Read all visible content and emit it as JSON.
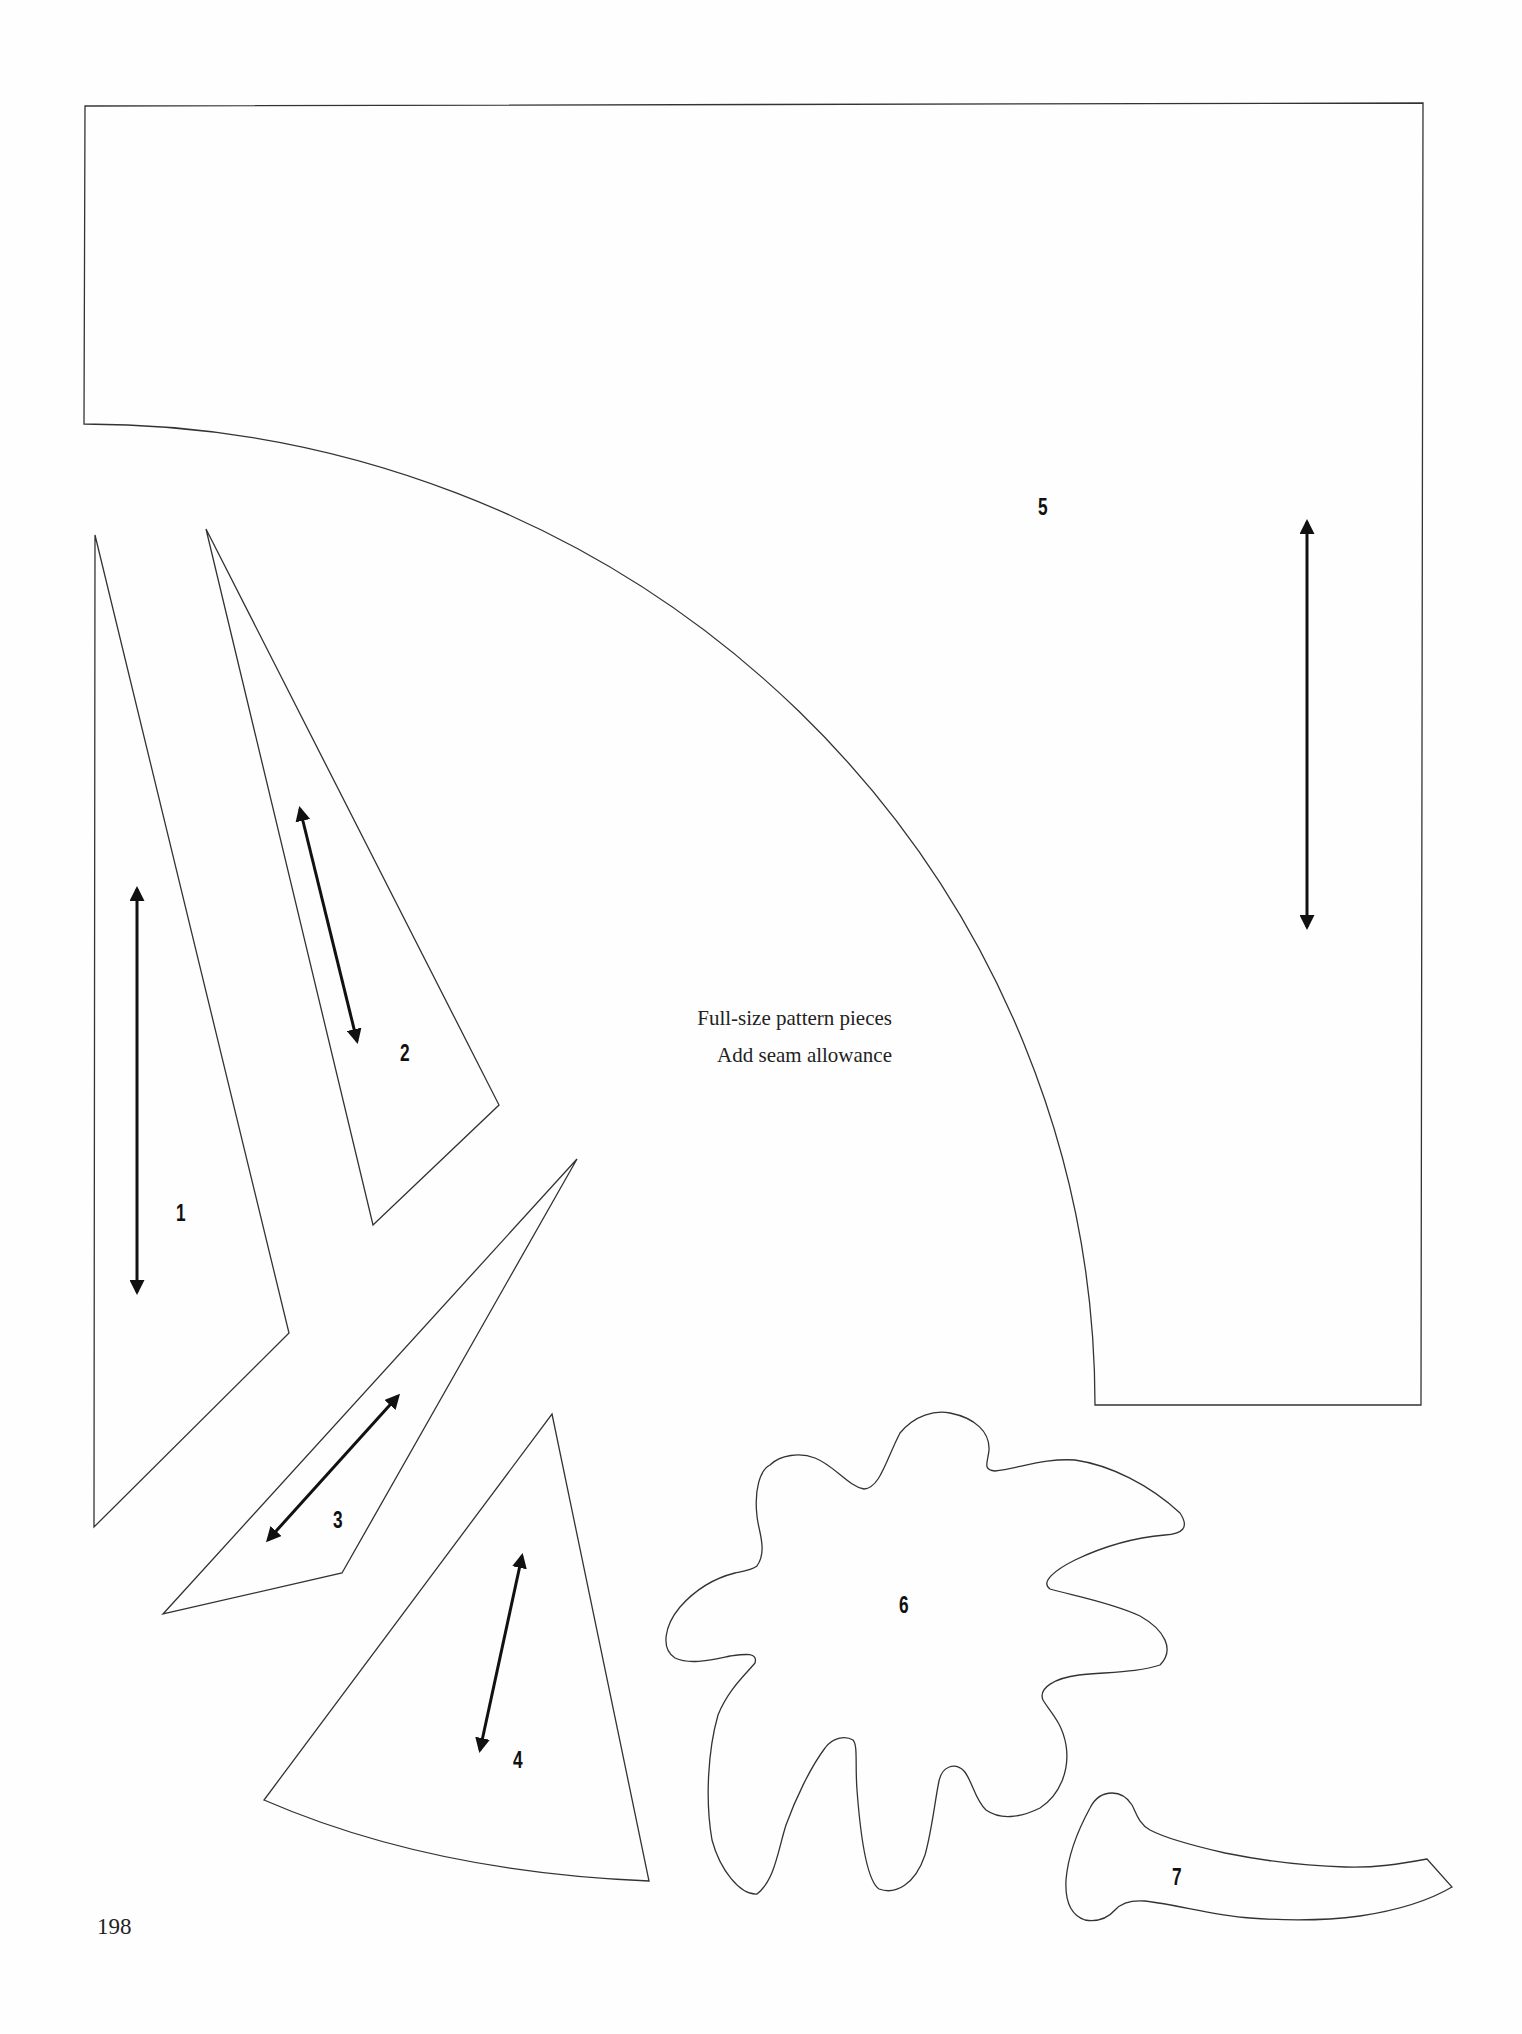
{
  "caption": {
    "line1": "Full-size pattern pieces",
    "line2": "Add seam allowance"
  },
  "page_number": "198",
  "pieces": [
    {
      "id": 1,
      "label": "1"
    },
    {
      "id": 2,
      "label": "2"
    },
    {
      "id": 3,
      "label": "3"
    },
    {
      "id": 4,
      "label": "4"
    },
    {
      "id": 5,
      "label": "5"
    },
    {
      "id": 6,
      "label": "6"
    },
    {
      "id": 7,
      "label": "7"
    }
  ],
  "colors": {
    "outline": "#333333",
    "grainline": "#111111",
    "paper": "#fefefe"
  }
}
